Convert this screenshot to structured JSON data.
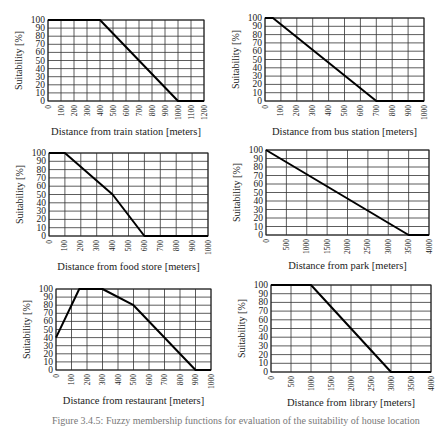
{
  "chart_data": [
    {
      "type": "line",
      "title": "",
      "xlabel": "Distance from train station [meters]",
      "ylabel": "Suitability [%]",
      "xlim": [
        0,
        1200
      ],
      "ylim": [
        0,
        100
      ],
      "xticks": [
        0,
        100,
        200,
        300,
        400,
        500,
        600,
        700,
        800,
        900,
        1000,
        1100,
        1200
      ],
      "yticks": [
        0,
        10,
        20,
        30,
        40,
        50,
        60,
        70,
        80,
        90,
        100
      ],
      "grid": true,
      "x": [
        0,
        400,
        1000,
        1200
      ],
      "values": [
        100,
        100,
        0,
        0
      ],
      "frame": {
        "left": 48,
        "top": 20,
        "right": 204,
        "bottom": 101
      }
    },
    {
      "type": "line",
      "title": "",
      "xlabel": "Distance from bus station [meters]",
      "ylabel": "Suitability [%]",
      "xlim": [
        0,
        1000
      ],
      "ylim": [
        0,
        100
      ],
      "xticks": [
        0,
        100,
        200,
        300,
        400,
        500,
        600,
        700,
        800,
        900,
        1000
      ],
      "yticks": [
        0,
        10,
        20,
        30,
        40,
        50,
        60,
        70,
        80,
        90,
        100
      ],
      "grid": true,
      "x": [
        0,
        50,
        700,
        1000
      ],
      "values": [
        100,
        100,
        0,
        0
      ],
      "frame": {
        "left": 265,
        "top": 18,
        "right": 424,
        "bottom": 101
      }
    },
    {
      "type": "line",
      "title": "",
      "xlabel": "Distance from food store [meters]",
      "ylabel": "Suitability [%]",
      "xlim": [
        0,
        1000
      ],
      "ylim": [
        0,
        100
      ],
      "xticks": [
        0,
        100,
        200,
        300,
        400,
        500,
        600,
        700,
        800,
        900,
        1000
      ],
      "yticks": [
        0,
        10,
        20,
        30,
        40,
        50,
        60,
        70,
        80,
        90,
        100
      ],
      "grid": true,
      "x": [
        0,
        100,
        400,
        600,
        1000
      ],
      "values": [
        100,
        100,
        50,
        0,
        0
      ],
      "frame": {
        "left": 49,
        "top": 153,
        "right": 208,
        "bottom": 236
      }
    },
    {
      "type": "line",
      "title": "",
      "xlabel": "Distance from park [meters]",
      "ylabel": "Suitability [%]",
      "xlim": [
        0,
        4000
      ],
      "ylim": [
        0,
        100
      ],
      "xticks": [
        0,
        500,
        1000,
        1500,
        2000,
        2500,
        3000,
        3500,
        4000
      ],
      "yticks": [
        0,
        10,
        20,
        30,
        40,
        50,
        60,
        70,
        80,
        90,
        100
      ],
      "grid": true,
      "x": [
        0,
        3500,
        4000
      ],
      "values": [
        100,
        0,
        0
      ],
      "frame": {
        "left": 266,
        "top": 150,
        "right": 429,
        "bottom": 235
      }
    },
    {
      "type": "line",
      "title": "",
      "xlabel": "Distance from restaurant [meters]",
      "ylabel": "Suitability [%]",
      "xlim": [
        0,
        1000
      ],
      "ylim": [
        0,
        100
      ],
      "xticks": [
        0,
        100,
        200,
        300,
        400,
        500,
        600,
        700,
        800,
        900,
        1000
      ],
      "yticks": [
        0,
        10,
        20,
        30,
        40,
        50,
        60,
        70,
        80,
        90,
        100
      ],
      "grid": true,
      "x": [
        0,
        150,
        300,
        500,
        900,
        1000
      ],
      "values": [
        40,
        100,
        100,
        80,
        0,
        0
      ],
      "frame": {
        "left": 56,
        "top": 289,
        "right": 211,
        "bottom": 370
      }
    },
    {
      "type": "line",
      "title": "",
      "xlabel": "Distance from library [meters]",
      "ylabel": "Suitability [%]",
      "xlim": [
        0,
        4000
      ],
      "ylim": [
        0,
        100
      ],
      "xticks": [
        0,
        500,
        1000,
        1500,
        2000,
        2500,
        3000,
        3500,
        4000
      ],
      "yticks": [
        0,
        10,
        20,
        30,
        40,
        50,
        60,
        70,
        80,
        90,
        100
      ],
      "grid": true,
      "x": [
        0,
        1000,
        3000,
        4000
      ],
      "values": [
        100,
        100,
        0,
        0
      ],
      "frame": {
        "left": 271,
        "top": 285,
        "right": 431,
        "bottom": 372
      }
    }
  ],
  "caption": "Figure 3.4.5: Fuzzy membership functions for evaluation of the suitability of house location"
}
